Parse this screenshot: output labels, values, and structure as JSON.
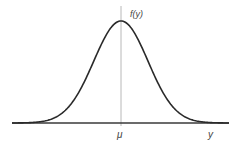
{
  "chart_data": {
    "type": "line",
    "title": "",
    "xlabel": "y",
    "ylabel": "f(y)",
    "x_tick_labels": [
      "μ"
    ],
    "series": [
      {
        "name": "f(y)",
        "distribution": "normal",
        "mean_label": "μ",
        "x": [
          -4,
          -3.5,
          -3,
          -2.5,
          -2,
          -1.5,
          -1,
          -0.5,
          0,
          0.5,
          1,
          1.5,
          2,
          2.5,
          3,
          3.5,
          4
        ],
        "values": [
          0.0001,
          0.0009,
          0.0044,
          0.0175,
          0.054,
          0.1295,
          0.242,
          0.3521,
          0.3989,
          0.3521,
          0.242,
          0.1295,
          0.054,
          0.0175,
          0.0044,
          0.0009,
          0.0001
        ]
      }
    ],
    "xlim": [
      -4,
      4
    ],
    "ylim": [
      0,
      0.4
    ],
    "grid": false,
    "legend": "none",
    "annotations": [
      {
        "type": "vertical-line",
        "at": "μ",
        "color": "#b0b0b0"
      }
    ]
  },
  "labels": {
    "y_axis": "f(y)",
    "x_axis": "y",
    "mean": "μ"
  },
  "colors": {
    "curve": "#2a2a2a",
    "axis": "#3a3a3a",
    "mean_line": "#b0b0b0",
    "text": "#444444"
  }
}
